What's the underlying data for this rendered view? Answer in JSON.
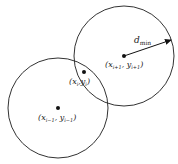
{
  "diagram": {
    "circles": [
      {
        "name": "left-circle",
        "cx": 58,
        "cy": 108,
        "r": 50
      },
      {
        "name": "right-circle",
        "cx": 124,
        "cy": 56,
        "r": 50
      }
    ],
    "points": [
      {
        "name": "point-prev",
        "x": 58,
        "y": 108,
        "label": "(x_{i-1}, y_{i-1})"
      },
      {
        "name": "point-current",
        "x": 84,
        "y": 72,
        "label": "(x_i, y_i)"
      },
      {
        "name": "point-next",
        "x": 124,
        "y": 56,
        "label": "(x_{i+1}, y_{i+1})"
      }
    ],
    "arrow": {
      "label": "d_min",
      "from": [
        124,
        56
      ],
      "to": [
        172,
        40
      ]
    },
    "labels": {
      "dmin_main": "d",
      "dmin_sub": "min",
      "prev_x": "x",
      "prev_xsub": "i−1",
      "prev_y": "y",
      "prev_ysub": "i−1",
      "cur_x": "x",
      "cur_xsub": "i",
      "cur_y": "y",
      "cur_ysub": "i",
      "next_x": "x",
      "next_xsub": "i+1",
      "next_y": "y",
      "next_ysub": "i+1"
    },
    "colors": {
      "stroke": "#333333",
      "dot": "#111111"
    }
  }
}
